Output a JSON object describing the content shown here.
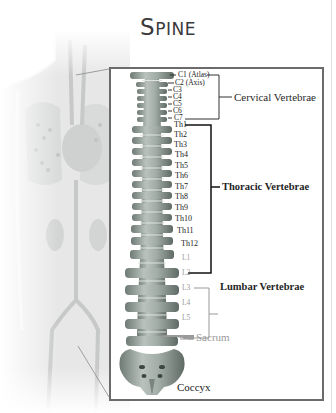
{
  "title": {
    "first": "S",
    "rest": "PINE"
  },
  "groups": {
    "cervical": "Cervical Vertebrae",
    "thoracic": "Thoracic Vertebrae",
    "lumbar": "Lumbar Vertebrae",
    "sacrum": "Sacrum",
    "coccyx": "Coccyx"
  },
  "cervical_labels": [
    "C1 (Atlas)",
    "C2 (Axis)",
    "C3",
    "C4",
    "C5",
    "C6",
    "C7"
  ],
  "thoracic_labels": [
    "Th1",
    "Th2",
    "Th3",
    "Th4",
    "Th5",
    "Th6",
    "Th7",
    "Th8",
    "Th9",
    "Th10",
    "Th11",
    "Th12"
  ],
  "lumbar_labels": [
    "L1",
    "L2",
    "L3",
    "L4",
    "L5"
  ],
  "colors": {
    "frame": "#6b6b6b",
    "bone": "#a9b3ad",
    "bone_dark": "#6f7a74",
    "muted_label": "#9a9a9a",
    "title": "#3a3a3a"
  }
}
